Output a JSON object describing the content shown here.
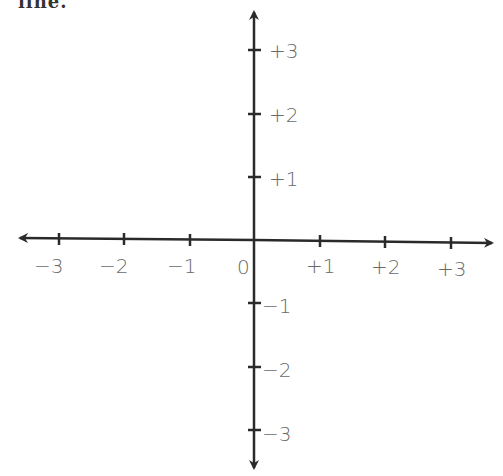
{
  "cut_text": "line.",
  "axes": {
    "origin_label": "0",
    "x_labels": [
      "−3",
      "−2",
      "−1",
      "+1",
      "+2",
      "+3"
    ],
    "y_labels": [
      "+3",
      "+2",
      "+1",
      "−1",
      "−2",
      "−3"
    ]
  },
  "colors": {
    "axis": "#2a2a2a",
    "label": "#6a6a6a"
  }
}
